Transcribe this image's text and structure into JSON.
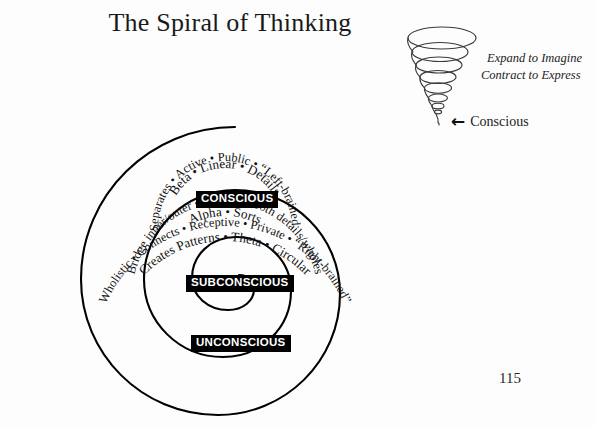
{
  "page": {
    "title": "The Spiral of Thinking",
    "page_number": "115",
    "background_color": "#fdfdfd",
    "ink_color": "#000000"
  },
  "vortex": {
    "caption_line1": "Expand to Imagine",
    "caption_line2": "Contract to Express",
    "pointer_arrow": "←",
    "pointer_label": "Conscious",
    "ring_count": 7
  },
  "spiral": {
    "turns": 3,
    "levels": [
      {
        "badge": "CONSCIOUS",
        "line_inner": "Beta • Linear • Details",
        "line_outer": "Separates • Active • Public • “Left-brained”"
      },
      {
        "badge": "SUBCONSCIOUS",
        "line_inner": "Alpha • Sorts",
        "line_outer": "Bridge inner/outer • Perceives both details/wholes"
      },
      {
        "badge": "UNCONSCIOUS",
        "line_inner": "Creates Patterns • Theta • Circular",
        "line_outer": "Wholistic • Connects • Receptive • Private • “Right-brained”"
      }
    ]
  }
}
